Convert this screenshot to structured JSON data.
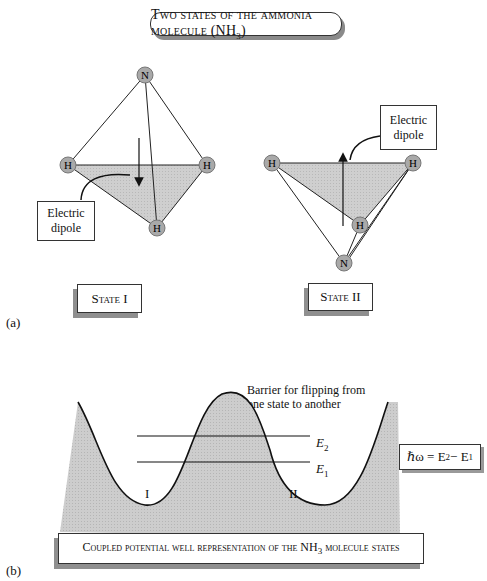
{
  "title": {
    "prefix": "Two states of the ammonia molecule (NH",
    "subscript": "3",
    "suffix": ")"
  },
  "panel_a": {
    "label": "(a)",
    "state1": {
      "label": "State I",
      "dipole_callout": [
        "Electric",
        "dipole"
      ],
      "atoms": [
        "N",
        "H",
        "H",
        "H"
      ]
    },
    "state2": {
      "label": "State II",
      "dipole_callout": [
        "Electric",
        "dipole"
      ],
      "atoms": [
        "N",
        "H",
        "H",
        "H"
      ]
    }
  },
  "panel_b": {
    "label": "(b)",
    "barrier_annotation": [
      "Barrier for flipping from",
      "one state to another"
    ],
    "levels": [
      {
        "symbol": "E",
        "subscript": "2"
      },
      {
        "symbol": "E",
        "subscript": "1"
      }
    ],
    "wells": [
      "I",
      "II"
    ],
    "equation": {
      "text": "ℏω = E",
      "sub2": "2",
      "mid": " − E",
      "sub1": "1"
    },
    "caption": {
      "prefix": "Coupled potential well representation of the NH",
      "subscript": "3",
      "suffix": " molecule states"
    }
  },
  "colors": {
    "fill_gray": "#c8c8c8",
    "atom_gray": "#a9a9a9",
    "shadow_gray": "#8a8a8a",
    "line": "#222222"
  }
}
